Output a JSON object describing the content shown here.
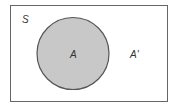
{
  "diagram": {
    "type": "venn",
    "universal_set_label": "S",
    "set_label": "A",
    "complement_label": "A'",
    "colors": {
      "border": "#555555",
      "circle_fill": "#c8c8c8",
      "circle_stroke": "#555555",
      "background": "#ffffff"
    }
  }
}
